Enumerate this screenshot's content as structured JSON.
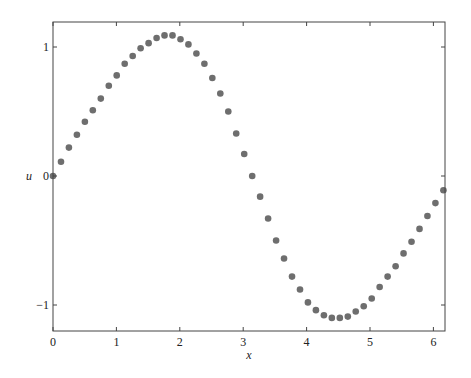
{
  "chart_data": {
    "type": "scatter",
    "title": "",
    "xlabel": "x",
    "ylabel": "u",
    "xlim": [
      0,
      6.2
    ],
    "ylim": [
      -1.22,
      1.2
    ],
    "xticks": [
      0,
      1,
      2,
      3,
      4,
      5,
      6
    ],
    "xtick_labels": [
      "0",
      "1",
      "2",
      "3",
      "4",
      "5",
      "6"
    ],
    "yticks": [
      -1,
      0,
      1
    ],
    "ytick_labels": [
      "−1",
      "0",
      "1"
    ],
    "grid": false,
    "legend": null,
    "marker_color": "#6e6e6e",
    "frame_color": "#444444",
    "series": [
      {
        "name": "u",
        "x": [
          0.0,
          0.126,
          0.251,
          0.377,
          0.503,
          0.628,
          0.754,
          0.88,
          1.005,
          1.131,
          1.257,
          1.382,
          1.508,
          1.634,
          1.759,
          1.885,
          2.011,
          2.136,
          2.262,
          2.388,
          2.513,
          2.639,
          2.765,
          2.89,
          3.016,
          3.142,
          3.267,
          3.393,
          3.519,
          3.644,
          3.77,
          3.896,
          4.021,
          4.147,
          4.273,
          4.398,
          4.524,
          4.65,
          4.775,
          4.901,
          5.027,
          5.152,
          5.278,
          5.404,
          5.529,
          5.655,
          5.781,
          5.906,
          6.032,
          6.158
        ],
        "y": [
          0.0,
          0.11,
          0.22,
          0.32,
          0.42,
          0.51,
          0.6,
          0.7,
          0.78,
          0.87,
          0.93,
          0.99,
          1.03,
          1.07,
          1.09,
          1.09,
          1.06,
          1.02,
          0.95,
          0.87,
          0.76,
          0.64,
          0.5,
          0.33,
          0.17,
          0.0,
          -0.16,
          -0.33,
          -0.5,
          -0.64,
          -0.78,
          -0.88,
          -0.98,
          -1.04,
          -1.08,
          -1.1,
          -1.1,
          -1.09,
          -1.05,
          -1.01,
          -0.95,
          -0.86,
          -0.78,
          -0.7,
          -0.6,
          -0.51,
          -0.41,
          -0.31,
          -0.21,
          -0.11
        ]
      }
    ]
  }
}
